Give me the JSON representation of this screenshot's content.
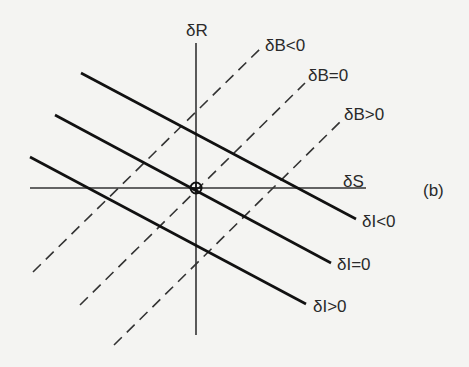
{
  "diagram": {
    "panel_label": "(b)",
    "axes": {
      "vertical": "δR",
      "horizontal": "δS"
    },
    "dashed_lines": [
      {
        "label": "δB<0"
      },
      {
        "label": "δB=0"
      },
      {
        "label": "δB>0"
      }
    ],
    "solid_lines": [
      {
        "label": "δI<0"
      },
      {
        "label": "δI=0"
      },
      {
        "label": "δI>0"
      }
    ],
    "origin_marker": "circled-cross"
  }
}
